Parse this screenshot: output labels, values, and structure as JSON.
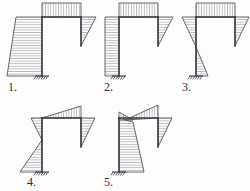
{
  "figure": {
    "background_color": "#fdfdfd",
    "line_color": "#3a3a42",
    "hatch_color": "#70707a",
    "diagram_outline_color": "#55555f",
    "label_color": "#2e2e36",
    "options": [
      {
        "id": "option-1",
        "label": "1.",
        "label_x": 8,
        "label_y": 91,
        "frame": {
          "left_column_x": 42,
          "right_column_x": 81,
          "beam_y": 17,
          "base_y": 76,
          "right_column_bottom_y": 46
        },
        "support": {
          "x": 42,
          "y": 76,
          "type": "fixed-support"
        },
        "diagrams": [
          {
            "name": "left-column-moment-region",
            "shape": "trapezoid",
            "side": "left",
            "hatch": "horizontal",
            "points": "42,17 16,17 7,76 42,76"
          },
          {
            "name": "beam-moment-region",
            "shape": "rectangle",
            "side": "top",
            "hatch": "vertical",
            "points": "42,17 81,17 81,3 42,3"
          },
          {
            "name": "right-column-moment-region",
            "shape": "triangle",
            "side": "right",
            "hatch": "horizontal",
            "points": "81,17 96,17 81,46"
          }
        ]
      },
      {
        "id": "option-2",
        "label": "2.",
        "label_x": 104,
        "label_y": 91,
        "frame": {
          "left_column_x": 119,
          "right_column_x": 158,
          "beam_y": 17,
          "base_y": 76,
          "right_column_bottom_y": 46
        },
        "support": {
          "x": 119,
          "y": 76,
          "type": "fixed-support"
        },
        "diagrams": [
          {
            "name": "left-column-moment-region",
            "shape": "rectangle",
            "side": "left",
            "hatch": "horizontal",
            "points": "119,17 105,17 105,76 119,76"
          },
          {
            "name": "beam-moment-region",
            "shape": "rectangle",
            "side": "top",
            "hatch": "vertical",
            "points": "119,17 158,17 158,3 119,3"
          },
          {
            "name": "right-column-moment-region",
            "shape": "triangle",
            "side": "right",
            "hatch": "horizontal",
            "points": "158,17 173,17 158,46"
          }
        ]
      },
      {
        "id": "option-3",
        "label": "3.",
        "label_x": 182,
        "label_y": 91,
        "frame": {
          "left_column_x": 196,
          "right_column_x": 235,
          "beam_y": 17,
          "base_y": 76,
          "right_column_bottom_y": 46
        },
        "support": {
          "x": 196,
          "y": 76,
          "type": "fixed-support"
        },
        "diagrams": [
          {
            "name": "left-column-moment-upper-triangle",
            "shape": "triangle",
            "side": "left",
            "hatch": "horizontal",
            "points": "196,17 182,17 196,47"
          },
          {
            "name": "left-column-moment-lower-triangle",
            "shape": "triangle",
            "side": "right",
            "hatch": "horizontal",
            "points": "196,47 208,76 196,76"
          },
          {
            "name": "beam-moment-region",
            "shape": "rectangle",
            "side": "top",
            "hatch": "vertical",
            "points": "196,17 235,17 235,3 196,3"
          },
          {
            "name": "right-column-moment-region",
            "shape": "triangle",
            "side": "right",
            "hatch": "horizontal",
            "points": "235,17 249,17 235,46"
          }
        ]
      },
      {
        "id": "option-4",
        "label": "4.",
        "label_x": 27,
        "label_y": 186,
        "frame": {
          "left_column_x": 42,
          "right_column_x": 81,
          "beam_y": 118,
          "base_y": 172,
          "right_column_bottom_y": 147
        },
        "support": {
          "x": 42,
          "y": 172,
          "type": "fixed-support"
        },
        "diagrams": [
          {
            "name": "left-column-upper-moment-region",
            "shape": "triangle",
            "side": "left",
            "hatch": "horizontal",
            "points": "42,118 31,118 42,140"
          },
          {
            "name": "left-column-lower-moment-region",
            "shape": "triangle",
            "side": "left",
            "hatch": "horizontal",
            "points": "42,140 20,172 42,172"
          },
          {
            "name": "beam-moment-region",
            "shape": "triangle",
            "side": "top",
            "hatch": "vertical",
            "points": "42,118 81,118 81,106"
          },
          {
            "name": "right-column-moment-region",
            "shape": "triangle",
            "side": "right",
            "hatch": "horizontal",
            "points": "81,118 95,118 81,147"
          }
        ]
      },
      {
        "id": "option-5",
        "label": "5.",
        "label_x": 104,
        "label_y": 186,
        "frame": {
          "left_column_x": 119,
          "right_column_x": 158,
          "beam_y": 118,
          "base_y": 172,
          "right_column_bottom_y": 147
        },
        "support": {
          "x": 119,
          "y": 172,
          "type": "fixed-support"
        },
        "diagrams": [
          {
            "name": "left-column-moment-region",
            "shape": "quadrilateral",
            "side": "right",
            "hatch": "horizontal",
            "points": "119,118 133,122 144,172 119,172"
          },
          {
            "name": "left-column-top-cap-region",
            "shape": "triangle",
            "side": "left",
            "hatch": "vertical",
            "points": "119,112 133,120 119,120"
          },
          {
            "name": "beam-moment-region",
            "shape": "triangle",
            "side": "top",
            "hatch": "vertical",
            "points": "125,120 158,118 158,105"
          },
          {
            "name": "right-column-moment-region",
            "shape": "triangle",
            "side": "right",
            "hatch": "horizontal",
            "points": "158,118 172,118 158,147"
          }
        ]
      }
    ]
  }
}
